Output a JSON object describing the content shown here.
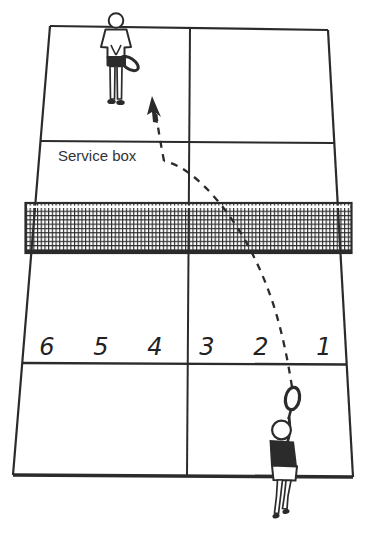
{
  "figure": {
    "background_color": "#ffffff",
    "ink_color": "#2b2b2b"
  },
  "labels": {
    "service_box": "Service box"
  },
  "zones": {
    "labels": [
      "6",
      "5",
      "4",
      "3",
      "2",
      "1"
    ]
  },
  "icons": {
    "receiver": "receiver-player-icon",
    "server": "server-player-icon",
    "net": "net-icon",
    "bounce_arrow": "bounce-arrowhead-icon"
  }
}
